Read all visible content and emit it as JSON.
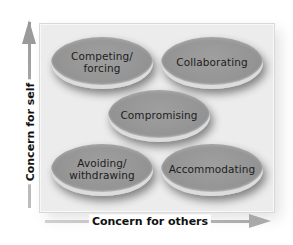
{
  "diagram": {
    "type": "conflict-management-styles-grid",
    "axes": {
      "y": {
        "label": "Concern for self",
        "direction": "up"
      },
      "x": {
        "label": "Concern for others",
        "direction": "right"
      }
    },
    "styles": [
      {
        "id": "competing",
        "label": "Competing/\nforcing",
        "position": "top-left",
        "cx": 102,
        "cy": 63
      },
      {
        "id": "collaborating",
        "label": "Collaborating",
        "position": "top-right",
        "cx": 212,
        "cy": 63
      },
      {
        "id": "compromising",
        "label": "Compromising",
        "position": "center",
        "cx": 159,
        "cy": 116
      },
      {
        "id": "avoiding",
        "label": "Avoiding/\nwithdrawing",
        "position": "bottom-left",
        "cx": 102,
        "cy": 170
      },
      {
        "id": "accommodating",
        "label": "Accommodating",
        "position": "bottom-right",
        "cx": 212,
        "cy": 170
      }
    ],
    "colors": {
      "ellipse_fill": "#959595",
      "frame_fill": "#ececec",
      "arrow": "#9a9a9a",
      "text": "#1d1d1d"
    }
  }
}
